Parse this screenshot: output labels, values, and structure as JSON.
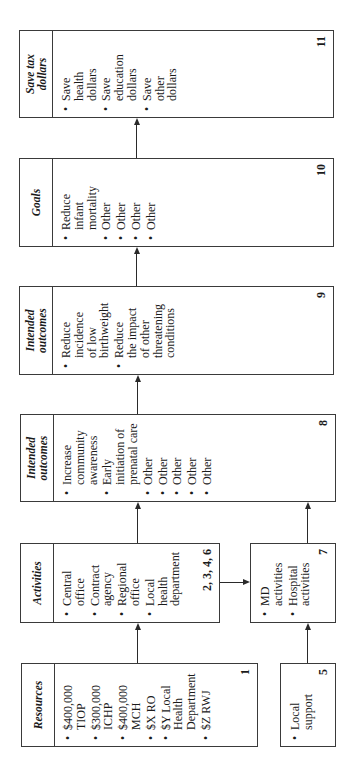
{
  "diagram": {
    "orientation": "rotated-90-ccw",
    "boxes": [
      {
        "id": "1",
        "header": "Resources",
        "items": [
          "$400,000\nTIOP",
          "$300,000\nICHP",
          "$400,000\nMCH",
          "$X RO",
          "$Y Local\nHealth\nDepartment",
          "$Z RWJ"
        ],
        "number": "1"
      },
      {
        "id": "5",
        "header": "",
        "items": [
          "Local\nsupport"
        ],
        "number": "5"
      },
      {
        "id": "2-3-4-6",
        "header": "Activities",
        "items": [
          "Central\noffice",
          "Contract\nagency",
          "Regional\noffice",
          "Local\nhealth\ndepartment"
        ],
        "number": "2, 3, 4, 6"
      },
      {
        "id": "7",
        "header": "",
        "items": [
          "MD\nactivities",
          "Hospital\nactivities"
        ],
        "number": "7"
      },
      {
        "id": "8",
        "header": "Intended\noutcomes",
        "items": [
          "Increase\ncommunity\nawareness",
          "Early\ninitiation of\nprenatal care",
          "Other",
          "Other",
          "Other",
          "Other",
          "Other"
        ],
        "number": "8"
      },
      {
        "id": "9",
        "header": "Intended\noutcomes",
        "items": [
          "Reduce\nincidence\nof low\nbirthweight",
          "Reduce\nthe impact\nof other\nthreatening\nconditions"
        ],
        "number": "9"
      },
      {
        "id": "10",
        "header": "Goals",
        "items": [
          "Reduce\ninfant\nmortality",
          "Other",
          "Other",
          "Other",
          "Other"
        ],
        "number": "10"
      },
      {
        "id": "11",
        "header": "Save tax\ndollars",
        "items": [
          "Save\nhealth\ndollars",
          "Save\neducation\ndollars",
          "Save\nother\ndollars"
        ],
        "number": "11"
      }
    ],
    "connections": [
      {
        "from": "1",
        "to": "2-3-4-6"
      },
      {
        "from": "5",
        "to": "7"
      },
      {
        "from": "2-3-4-6",
        "to": "7"
      },
      {
        "from": "2-3-4-6",
        "to": "8"
      },
      {
        "from": "7",
        "to": "8"
      },
      {
        "from": "8",
        "to": "9"
      },
      {
        "from": "9",
        "to": "10"
      },
      {
        "from": "10",
        "to": "11"
      }
    ]
  }
}
